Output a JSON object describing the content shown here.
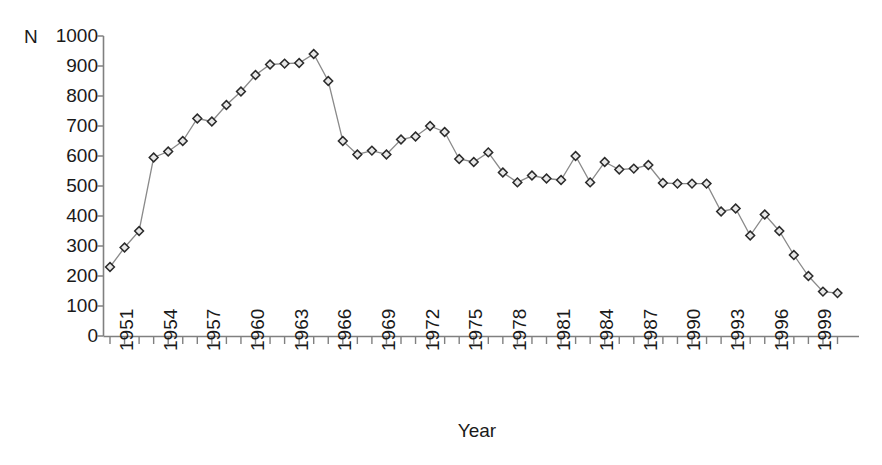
{
  "chart_data": {
    "type": "line",
    "title": "",
    "xlabel": "Year",
    "ylabel": "N",
    "y_axis_prefix_label": "N",
    "grid": false,
    "legend": "none",
    "marker": "diamond",
    "ylim": [
      0,
      1000
    ],
    "ytick_labels": [
      "1000",
      "900",
      "800",
      "700",
      "600",
      "500",
      "400",
      "300",
      "200",
      "100",
      "0"
    ],
    "yticks": [
      1000,
      900,
      800,
      700,
      600,
      500,
      400,
      300,
      200,
      100,
      0
    ],
    "xtick_labels": [
      "1951",
      "1954",
      "1957",
      "1960",
      "1963",
      "1966",
      "1969",
      "1972",
      "1975",
      "1978",
      "1981",
      "1984",
      "1987",
      "1990",
      "1993",
      "1996",
      "1999"
    ],
    "xticks": [
      1951,
      1954,
      1957,
      1960,
      1963,
      1966,
      1969,
      1972,
      1975,
      1978,
      1981,
      1984,
      1987,
      1990,
      1993,
      1996,
      1999
    ],
    "xlim": [
      1951,
      2001
    ],
    "x": [
      1951,
      1952,
      1953,
      1954,
      1955,
      1956,
      1957,
      1958,
      1959,
      1960,
      1961,
      1962,
      1963,
      1964,
      1965,
      1966,
      1967,
      1968,
      1969,
      1970,
      1971,
      1972,
      1973,
      1974,
      1975,
      1976,
      1977,
      1978,
      1979,
      1980,
      1981,
      1982,
      1983,
      1984,
      1985,
      1986,
      1987,
      1988,
      1989,
      1990,
      1991,
      1992,
      1993,
      1994,
      1995,
      1996,
      1997,
      1998,
      1999,
      2000,
      2001
    ],
    "values": [
      230,
      295,
      350,
      595,
      615,
      650,
      725,
      715,
      770,
      815,
      870,
      905,
      908,
      910,
      940,
      850,
      650,
      605,
      618,
      605,
      655,
      665,
      700,
      680,
      590,
      580,
      612,
      545,
      512,
      535,
      525,
      520,
      600,
      512,
      580,
      555,
      558,
      570,
      510,
      508,
      508,
      508,
      415,
      425,
      335,
      405,
      350,
      270,
      200,
      148,
      143
    ],
    "series": [
      {
        "name": "N",
        "values": [
          230,
          295,
          350,
          595,
          615,
          650,
          725,
          715,
          770,
          815,
          870,
          905,
          908,
          910,
          940,
          850,
          650,
          605,
          618,
          605,
          655,
          665,
          700,
          680,
          590,
          580,
          612,
          545,
          512,
          535,
          525,
          520,
          600,
          512,
          580,
          555,
          558,
          570,
          510,
          508,
          508,
          508,
          415,
          425,
          335,
          405,
          350,
          270,
          200,
          148,
          143
        ]
      }
    ],
    "line_color": "#8a8a8a",
    "marker_fill": "#e8e8e8",
    "marker_edge": "#2b2b2b",
    "axis_color": "#808080",
    "text_color": "#1a1a1a"
  }
}
